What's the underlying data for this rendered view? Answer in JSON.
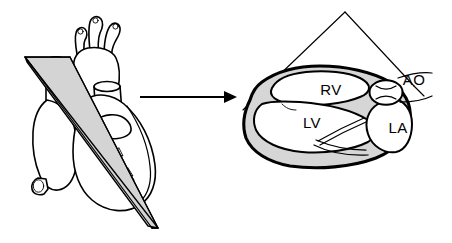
{
  "figure": {
    "panels": [
      {
        "id": "left-panel",
        "name": "whole-heart-with-imaging-plane",
        "description": "Anterior view of the whole heart with great vessels and an oblique tomographic cutting plane passing through it"
      },
      {
        "id": "right-panel",
        "name": "cross-section-view",
        "description": "Sector scan cross-section of the heart produced by the imaging plane, showing cardiac chambers"
      }
    ]
  },
  "connector": {
    "name": "transform-arrow",
    "direction": "left-to-right",
    "label": ""
  },
  "labels": {
    "rv": "RV",
    "lv": "LV",
    "ao": "AO",
    "la": "LA"
  },
  "colors": {
    "outline": "#000000",
    "background": "#ffffff",
    "plane_shade": "#d4d4d4",
    "myocardium_fill": "#d6d6d6",
    "chamber_fill": "#ffffff"
  }
}
